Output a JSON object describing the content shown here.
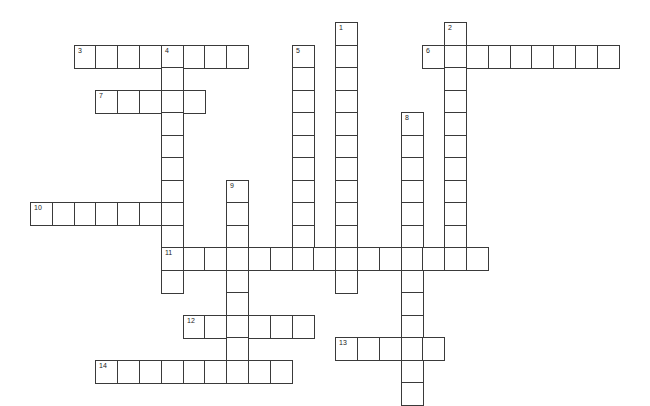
{
  "puzzle": {
    "type": "crossword",
    "grid": {
      "origin_x": 30,
      "origin_y": 22,
      "cell_w": 21.8,
      "cell_h": 22.5
    },
    "colors": {
      "line": "#3a3a3a",
      "background": "#ffffff",
      "number": "#222222"
    },
    "words": [
      {
        "number": "1",
        "direction": "down",
        "col": 14,
        "row": 0,
        "length": 12
      },
      {
        "number": "2",
        "direction": "down",
        "col": 19,
        "row": 0,
        "length": 11
      },
      {
        "number": "3",
        "direction": "across",
        "col": 2,
        "row": 1,
        "length": 8
      },
      {
        "number": "4",
        "direction": "down",
        "col": 6,
        "row": 1,
        "length": 11
      },
      {
        "number": "5",
        "direction": "down",
        "col": 12,
        "row": 1,
        "length": 10
      },
      {
        "number": "6",
        "direction": "across",
        "col": 18,
        "row": 1,
        "length": 9
      },
      {
        "number": "7",
        "direction": "across",
        "col": 3,
        "row": 3,
        "length": 5
      },
      {
        "number": "8",
        "direction": "down",
        "col": 17,
        "row": 4,
        "length": 13
      },
      {
        "number": "9",
        "direction": "down",
        "col": 9,
        "row": 7,
        "length": 9
      },
      {
        "number": "10",
        "direction": "across",
        "col": 0,
        "row": 8,
        "length": 7
      },
      {
        "number": "11",
        "direction": "across",
        "col": 6,
        "row": 10,
        "length": 15
      },
      {
        "number": "12",
        "direction": "across",
        "col": 7,
        "row": 13,
        "length": 6
      },
      {
        "number": "13",
        "direction": "across",
        "col": 14,
        "row": 14,
        "length": 5
      },
      {
        "number": "14",
        "direction": "across",
        "col": 3,
        "row": 15,
        "length": 9
      }
    ]
  }
}
